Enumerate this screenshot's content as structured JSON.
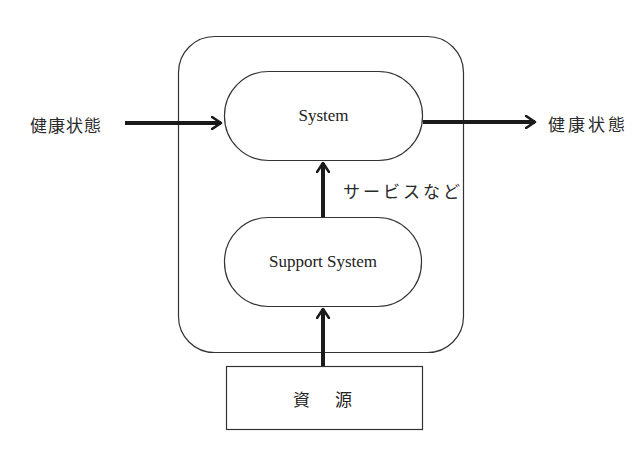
{
  "diagram": {
    "input_label": "健康状態",
    "output_label": "健康状態",
    "system_label": "System",
    "support_system_label": "Support System",
    "service_label": "サービスなど",
    "resource_label": "資　源"
  },
  "colors": {
    "stroke": "#333333",
    "arrow": "#1a1a1a",
    "background": "#ffffff"
  }
}
